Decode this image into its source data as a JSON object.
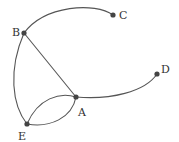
{
  "diagram": {
    "type": "graph",
    "nodes": [
      {
        "id": "A",
        "label": "A",
        "x": 76,
        "y": 97,
        "label_x": 78,
        "label_y": 116
      },
      {
        "id": "B",
        "label": "B",
        "x": 24,
        "y": 33,
        "label_x": 12,
        "label_y": 36
      },
      {
        "id": "C",
        "label": "C",
        "x": 113,
        "y": 15,
        "label_x": 119,
        "label_y": 19
      },
      {
        "id": "D",
        "label": "D",
        "x": 157,
        "y": 74,
        "label_x": 161,
        "label_y": 73
      },
      {
        "id": "E",
        "label": "E",
        "x": 27,
        "y": 124,
        "label_x": 18,
        "label_y": 140
      }
    ],
    "edges": [
      {
        "from": "B",
        "to": "C",
        "curved": true
      },
      {
        "from": "B",
        "to": "A",
        "curved": false
      },
      {
        "from": "B",
        "to": "E",
        "curved": true
      },
      {
        "from": "A",
        "to": "D",
        "curved": true
      },
      {
        "from": "E",
        "to": "A",
        "curved": true,
        "note": "upper arc"
      },
      {
        "from": "E",
        "to": "A",
        "curved": true,
        "note": "lower arc"
      }
    ]
  }
}
